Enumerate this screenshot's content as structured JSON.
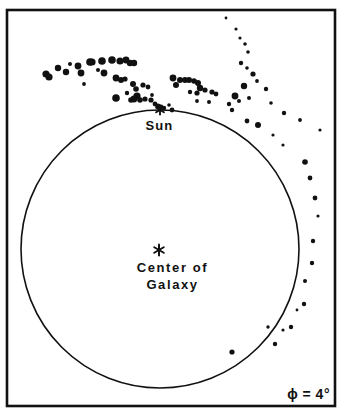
{
  "figure": {
    "width": 347,
    "height": 415,
    "background_color": "#ffffff",
    "ink_color": "#111111"
  },
  "frame": {
    "name": "plot-border",
    "x": 7,
    "y": 10,
    "width": 328,
    "height": 396,
    "stroke_width": 2.6
  },
  "circle": {
    "name": "galactic-circle",
    "cx": 160,
    "cy": 249,
    "r": 139,
    "stroke_width": 1.6
  },
  "labels": {
    "sun": "Sun",
    "center_line1": "Center of",
    "center_line2": "Galaxy",
    "phi": "ϕ = 4°"
  },
  "markers": {
    "sun_star": {
      "name": "sun-star-marker",
      "cx": 160,
      "cy": 110,
      "size": 9
    },
    "galaxy_center_star": {
      "name": "galaxy-center-star-marker",
      "cx": 159,
      "cy": 250,
      "size": 11
    }
  },
  "chart_data": {
    "type": "scatter",
    "title": "Center of Galaxy",
    "xlabel": "",
    "ylabel": "",
    "annotations": [
      "Sun",
      "Center of Galaxy",
      "ϕ = 4°"
    ],
    "legend": [],
    "grid": false,
    "xlim": [
      7,
      335
    ],
    "ylim": [
      406,
      10
    ],
    "series": [
      {
        "name": "hydrogen-clouds",
        "marker": "filled-circle",
        "points": [
          [
            46,
            74,
            3.6
          ],
          [
            58,
            68,
            3.2
          ],
          [
            70,
            64,
            2.0
          ],
          [
            78,
            66,
            3.4
          ],
          [
            81,
            73,
            3.4
          ],
          [
            92,
            62,
            3.6
          ],
          [
            98,
            70,
            2.0
          ],
          [
            102,
            61,
            3.8
          ],
          [
            112,
            60,
            3.8
          ],
          [
            120,
            61,
            3.6
          ],
          [
            130,
            63,
            3.2
          ],
          [
            134,
            63,
            3.2
          ],
          [
            126,
            60,
            3.4
          ],
          [
            90,
            62,
            3.8
          ],
          [
            49,
            77,
            3.6
          ],
          [
            66,
            72,
            3.2
          ],
          [
            84,
            84,
            1.9
          ],
          [
            104,
            73,
            3.4
          ],
          [
            116,
            78,
            3.4
          ],
          [
            121,
            80,
            3.0
          ],
          [
            125,
            79,
            2.6
          ],
          [
            116,
            98,
            3.8
          ],
          [
            133,
            84,
            3.0
          ],
          [
            136,
            89,
            2.8
          ],
          [
            143,
            85,
            2.6
          ],
          [
            148,
            87,
            2.4
          ],
          [
            137,
            96,
            3.6
          ],
          [
            134,
            99,
            3.4
          ],
          [
            140,
            100,
            2.8
          ],
          [
            145,
            99,
            2.6
          ],
          [
            151,
            100,
            2.6
          ],
          [
            131,
            100,
            2.8
          ],
          [
            152,
            95,
            1.9
          ],
          [
            127,
            93,
            2.2
          ],
          [
            155,
            104,
            2.4
          ],
          [
            158,
            106,
            2.6
          ],
          [
            161,
            107,
            2.4
          ],
          [
            164,
            108,
            2.2
          ],
          [
            169,
            105,
            1.8
          ],
          [
            172,
            110,
            2.4
          ],
          [
            173,
            78,
            3.4
          ],
          [
            180,
            80,
            3.0
          ],
          [
            185,
            80,
            3.0
          ],
          [
            189,
            80,
            3.0
          ],
          [
            194,
            81,
            2.8
          ],
          [
            198,
            83,
            3.0
          ],
          [
            176,
            85,
            3.0
          ],
          [
            200,
            88,
            3.2
          ],
          [
            190,
            92,
            2.2
          ],
          [
            197,
            93,
            2.6
          ],
          [
            205,
            90,
            2.6
          ],
          [
            212,
            92,
            2.6
          ],
          [
            216,
            94,
            2.4
          ],
          [
            197,
            101,
            1.9
          ],
          [
            209,
            102,
            2.0
          ],
          [
            226,
            18,
            1.4
          ],
          [
            236,
            29,
            1.6
          ],
          [
            240,
            38,
            1.6
          ],
          [
            245,
            44,
            1.8
          ],
          [
            248,
            52,
            1.8
          ],
          [
            241,
            63,
            2.2
          ],
          [
            247,
            68,
            1.8
          ],
          [
            253,
            74,
            2.6
          ],
          [
            257,
            81,
            1.9
          ],
          [
            244,
            86,
            3.2
          ],
          [
            235,
            96,
            3.4
          ],
          [
            239,
            101,
            2.0
          ],
          [
            229,
            104,
            2.2
          ],
          [
            232,
            110,
            2.2
          ],
          [
            249,
            98,
            2.0
          ],
          [
            266,
            89,
            2.2
          ],
          [
            271,
            103,
            1.8
          ],
          [
            247,
            121,
            2.4
          ],
          [
            258,
            125,
            3.0
          ],
          [
            284,
            113,
            2.2
          ],
          [
            273,
            135,
            1.6
          ],
          [
            283,
            145,
            1.6
          ],
          [
            300,
            120,
            1.9
          ],
          [
            320,
            130,
            1.6
          ],
          [
            305,
            162,
            2.8
          ],
          [
            310,
            178,
            2.4
          ],
          [
            315,
            198,
            2.4
          ],
          [
            318,
            216,
            1.6
          ],
          [
            313,
            241,
            2.2
          ],
          [
            312,
            263,
            2.2
          ],
          [
            305,
            281,
            2.0
          ],
          [
            304,
            304,
            2.2
          ],
          [
            297,
            310,
            1.4
          ],
          [
            291,
            327,
            2.2
          ],
          [
            283,
            330,
            1.6
          ],
          [
            268,
            327,
            1.7
          ],
          [
            275,
            344,
            2.2
          ],
          [
            232,
            352,
            2.6
          ]
        ]
      }
    ]
  }
}
